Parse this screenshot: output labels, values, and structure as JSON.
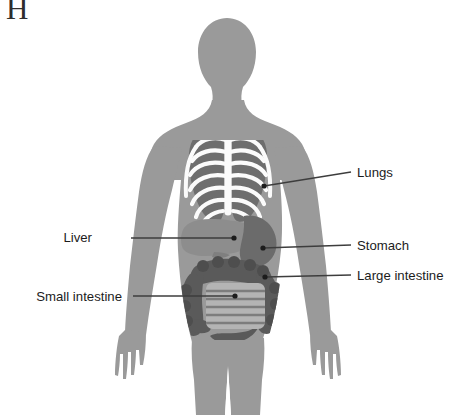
{
  "figure": {
    "letter": "H",
    "background_color": "#ffffff"
  },
  "palette": {
    "body_silhouette": "#9a9a9a",
    "ribcage_bone": "#fbfbfb",
    "lung": "#6e6e6e",
    "liver": "#8d8d8d",
    "stomach": "#6b6b6b",
    "large_intestine": "#5a5a5a",
    "small_intestine": "#b4b4b4",
    "leader_line": "#3d3d3d",
    "label_text": "#1c1c1c"
  },
  "labels": [
    {
      "id": "lungs",
      "text": "Lungs",
      "side": "right",
      "text_x": 357,
      "text_y": 166,
      "line_x1": 320,
      "line_y1": 172,
      "line_x2": 351,
      "line_y2": 172,
      "dot_x": 264,
      "dot_y": 186
    },
    {
      "id": "liver",
      "text": "Liver",
      "side": "left",
      "text_x": 92,
      "text_y": 231,
      "line_x1": 131,
      "line_y1": 238,
      "line_x2": 230,
      "line_y2": 238,
      "dot_x": 234,
      "dot_y": 238
    },
    {
      "id": "stomach",
      "text": "Stomach",
      "side": "right",
      "text_x": 357,
      "text_y": 239,
      "line_x1": 312,
      "line_y1": 245,
      "line_x2": 351,
      "line_y2": 245,
      "dot_x": 263,
      "dot_y": 248
    },
    {
      "id": "large-intestine",
      "text": "Large intestine",
      "side": "right",
      "text_x": 357,
      "text_y": 269,
      "line_x1": 311,
      "line_y1": 275,
      "line_x2": 351,
      "line_y2": 275,
      "dot_x": 265,
      "dot_y": 277
    },
    {
      "id": "small-intestine",
      "text": "Small intestine",
      "side": "left",
      "text_x": 122,
      "text_y": 290,
      "line_x1": 133,
      "line_y1": 296,
      "line_x2": 231,
      "line_y2": 296,
      "dot_x": 235,
      "dot_y": 296
    }
  ],
  "organs": [
    {
      "id": "lungs",
      "name": "Lungs"
    },
    {
      "id": "liver",
      "name": "Liver"
    },
    {
      "id": "stomach",
      "name": "Stomach"
    },
    {
      "id": "large-intestine",
      "name": "Large intestine"
    },
    {
      "id": "small-intestine",
      "name": "Small intestine"
    },
    {
      "id": "ribcage",
      "name": "Ribcage"
    }
  ]
}
